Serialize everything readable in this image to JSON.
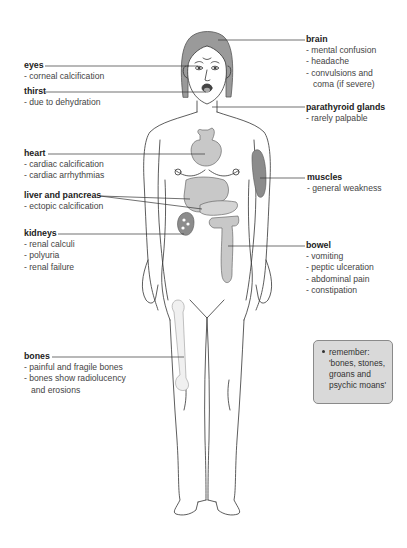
{
  "diagram": {
    "type": "anatomical-illustration"
  },
  "labels": {
    "eyes": {
      "title": "eyes",
      "items": [
        "- corneal calcification"
      ]
    },
    "thirst": {
      "title": "thirst",
      "items": [
        "- due to dehydration"
      ]
    },
    "brain": {
      "title": "brain",
      "items": [
        "- mental confusion",
        "- headache",
        "-  convulsions and",
        "coma (if severe)"
      ]
    },
    "parathyroid": {
      "title": "parathyroid glands",
      "items": [
        "- rarely palpable"
      ]
    },
    "heart": {
      "title": "heart",
      "items": [
        "- cardiac calcification",
        "- cardiac arrhythmias"
      ]
    },
    "liver": {
      "title": "liver and pancreas",
      "items": [
        "- ectopic calcification"
      ]
    },
    "muscles": {
      "title": "muscles",
      "items": [
        "- general weakness"
      ]
    },
    "kidneys": {
      "title": "kidneys",
      "items": [
        "- renal calculi",
        "- polyuria",
        "- renal failure"
      ]
    },
    "bowel": {
      "title": "bowel",
      "items": [
        "- vomiting",
        "- peptic ulceration",
        "- abdominal pain",
        "- constipation"
      ]
    },
    "bones": {
      "title": "bones",
      "items": [
        "- painful and fragile bones",
        "- bones show radiolucency",
        "and erosions"
      ]
    }
  },
  "remember_box": {
    "lines": [
      "remember:",
      "'bones, stones,",
      "groans and",
      "psychic moans'"
    ]
  },
  "colors": {
    "organ_fill": "#c8c8c8",
    "organ_dark": "#8c8c8c",
    "line": "#333333",
    "box_fill": "#d9d9d9"
  }
}
